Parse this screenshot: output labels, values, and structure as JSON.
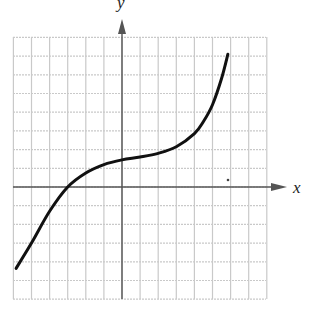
{
  "chart_data": {
    "type": "line",
    "title": "",
    "xlabel": "x",
    "ylabel": "y",
    "xlim": [
      -6,
      8
    ],
    "ylim": [
      -6,
      8
    ],
    "grid": true,
    "tick_labels": false,
    "grid_spacing": 1,
    "series": [
      {
        "name": "curve",
        "color": "#111111",
        "x": [
          -5.85,
          -5,
          -4,
          -3,
          -2,
          -1,
          0,
          1,
          2,
          3,
          4,
          4.5,
          5,
          5.5,
          5.85
        ],
        "y": [
          -4.35,
          -3.0,
          -1.3,
          0,
          0.75,
          1.2,
          1.45,
          1.6,
          1.8,
          2.15,
          2.85,
          3.5,
          4.4,
          5.8,
          7.1
        ]
      }
    ],
    "annotations": [
      {
        "type": "dot",
        "x": 5.9,
        "y": 0.4
      }
    ]
  },
  "colors": {
    "grid": "#c9c9c9",
    "axis": "#555555",
    "curve": "#111111"
  },
  "layout": {
    "origin_px": [
      122,
      187
    ],
    "cell_px_x": 18.1,
    "cell_px_y": 18.7,
    "grid_left_px": 13,
    "grid_top_px": 37,
    "grid_right_px": 266,
    "grid_bottom_px": 299
  }
}
